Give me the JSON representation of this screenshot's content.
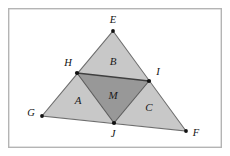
{
  "figure": {
    "background_color": "#ffffff",
    "frame": {
      "x": 8,
      "y": 8,
      "width": 214,
      "height": 140,
      "stroke_color": "#b4b4b4"
    },
    "colors": {
      "outer_region_fill": "#c8c8c8",
      "inner_region_fill": "#989898",
      "edge_stroke": "#6e6e6e",
      "inner_edge_stroke": "#4a4a4a",
      "vertex_dot": "#111111",
      "label_text": "#111111"
    },
    "vertices": [
      {
        "name": "E",
        "label": "E",
        "x": 113,
        "y": 31,
        "label_x": 113,
        "label_y": 21,
        "dot": true
      },
      {
        "name": "G",
        "label": "G",
        "x": 42,
        "y": 116,
        "label_x": 31,
        "label_y": 114,
        "dot": true
      },
      {
        "name": "F",
        "label": "F",
        "x": 186,
        "y": 131,
        "label_x": 196,
        "label_y": 134,
        "dot": true
      },
      {
        "name": "H",
        "label": "H",
        "x": 77,
        "y": 73,
        "label_x": 68,
        "label_y": 64,
        "dot": true
      },
      {
        "name": "I",
        "label": "I",
        "x": 149,
        "y": 81,
        "label_x": 158,
        "label_y": 73,
        "dot": true
      },
      {
        "name": "J",
        "label": "J",
        "x": 114,
        "y": 123,
        "label_x": 113,
        "label_y": 135,
        "dot": true
      }
    ],
    "regions": [
      {
        "name": "region-a",
        "label": "A",
        "label_x": 78,
        "label_y": 101,
        "points": "42,116 77,73 114,123",
        "fill": "#c8c8c8"
      },
      {
        "name": "region-b",
        "label": "B",
        "label_x": 113,
        "label_y": 62,
        "points": "77,73 113,31 149,81",
        "fill": "#c8c8c8"
      },
      {
        "name": "region-c",
        "label": "C",
        "label_x": 149,
        "label_y": 108,
        "points": "114,123 149,81 186,131",
        "fill": "#c8c8c8"
      },
      {
        "name": "region-m",
        "label": "M",
        "label_x": 113,
        "label_y": 96,
        "points": "77,73 149,81 114,123",
        "fill": "#989898"
      }
    ],
    "outer_triangle": {
      "name": "triangle-efg",
      "points": "113,31 186,131 42,116"
    },
    "edges": [
      {
        "name": "edge-e-g",
        "x1": 113,
        "y1": 31,
        "x2": 42,
        "y2": 116
      },
      {
        "name": "edge-e-f",
        "x1": 113,
        "y1": 31,
        "x2": 186,
        "y2": 131
      },
      {
        "name": "edge-g-f",
        "x1": 42,
        "y1": 116,
        "x2": 186,
        "y2": 131
      }
    ],
    "inner_edges": [
      {
        "name": "edge-h-i",
        "x1": 77,
        "y1": 73,
        "x2": 149,
        "y2": 81
      },
      {
        "name": "edge-h-j",
        "x1": 77,
        "y1": 73,
        "x2": 114,
        "y2": 123
      },
      {
        "name": "edge-i-j",
        "x1": 149,
        "y1": 81,
        "x2": 114,
        "y2": 123
      }
    ]
  }
}
